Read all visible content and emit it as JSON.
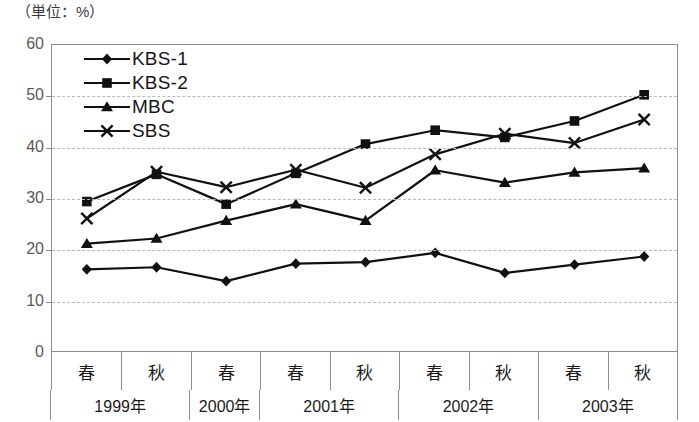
{
  "caption": "（単位：%）",
  "chart_data": {
    "type": "line",
    "title": "（単位：%）",
    "xlabel": "",
    "ylabel": "",
    "ylim": [
      0,
      60
    ],
    "yticks": [
      0,
      10,
      20,
      30,
      40,
      50,
      60
    ],
    "grid": true,
    "legend_position": "top-left",
    "categories": [
      "春",
      "秋",
      "春",
      "春",
      "秋",
      "春",
      "秋",
      "春",
      "秋"
    ],
    "x": [
      "1999年春",
      "1999年秋",
      "2000年春",
      "2001年春",
      "2001年秋",
      "2002年春",
      "2002年秋",
      "2003年春",
      "2003年秋"
    ],
    "year_groups": [
      {
        "label": "1999年",
        "seasons": [
          "春",
          "秋"
        ]
      },
      {
        "label": "2000年",
        "seasons": [
          "春"
        ]
      },
      {
        "label": "2001年",
        "seasons": [
          "春",
          "秋"
        ]
      },
      {
        "label": "2002年",
        "seasons": [
          "春",
          "秋"
        ]
      },
      {
        "label": "2003年",
        "seasons": [
          "春",
          "秋"
        ]
      }
    ],
    "series": [
      {
        "name": "KBS-1",
        "marker": "diamond",
        "values": [
          16.3,
          16.7,
          14.0,
          17.4,
          17.7,
          19.5,
          15.6,
          17.2,
          18.8
        ]
      },
      {
        "name": "KBS-2",
        "marker": "square",
        "values": [
          29.5,
          34.8,
          29.0,
          35.0,
          40.7,
          43.4,
          42.0,
          45.2,
          50.3
        ]
      },
      {
        "name": "MBC",
        "marker": "triangle",
        "values": [
          21.3,
          22.3,
          25.8,
          29.0,
          25.8,
          35.6,
          33.2,
          35.2,
          36.0
        ]
      },
      {
        "name": "SBS",
        "marker": "cross",
        "values": [
          26.2,
          35.3,
          32.3,
          35.7,
          32.2,
          38.7,
          42.7,
          40.9,
          45.5
        ]
      }
    ]
  },
  "colors": {
    "line": "#111111",
    "frame": "#8d8d8d",
    "grid": "#b9b9b9",
    "tick_label": "#5a5a5a",
    "background": "#ffffff"
  }
}
